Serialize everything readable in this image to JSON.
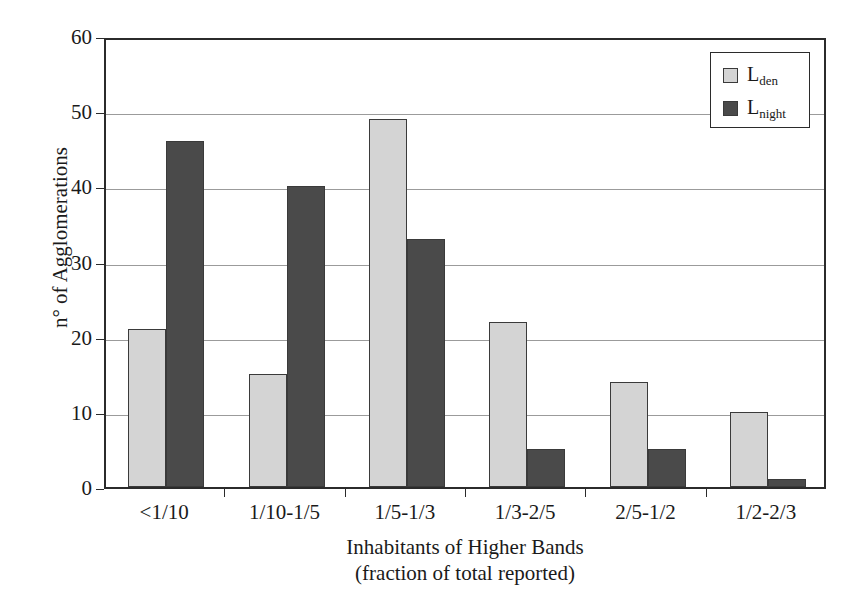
{
  "chart_data": {
    "type": "bar",
    "title": "",
    "subtitle": "",
    "xlabel": "Inhabitants of Higher Bands",
    "xlabel_line2": "(fraction of total reported)",
    "ylabel": "n° of Agglomerations",
    "categories": [
      "<1/10",
      "1/10-1/5",
      "1/5-1/3",
      "1/3-2/5",
      "2/5-1/2",
      "1/2-2/3"
    ],
    "series": [
      {
        "name": "Lden",
        "name_base": "L",
        "name_sub": "den",
        "color": "#d4d4d4",
        "values": [
          21,
          15,
          49,
          22,
          14,
          10
        ]
      },
      {
        "name": "Lnight",
        "name_base": "L",
        "name_sub": "night",
        "color": "#4a4a4a",
        "values": [
          46,
          40,
          33,
          5,
          5,
          1
        ]
      }
    ],
    "ylim": [
      0,
      60
    ],
    "yticks": [
      0,
      10,
      20,
      30,
      40,
      50,
      60
    ],
    "ytick_labels": [
      "0",
      "10",
      "20",
      "30",
      "40",
      "50",
      "60"
    ],
    "grid": "horizontal",
    "legend_position": "top-right",
    "bar_edge_color": "#3a3a3a",
    "frame_color": "#2b2b2b",
    "gridline_color": "#9b9b9b",
    "background": "#ffffff"
  }
}
